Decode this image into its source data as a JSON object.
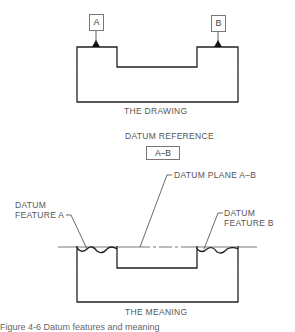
{
  "drawing": {
    "datum_a_label": "A",
    "datum_b_label": "B",
    "title": "THE DRAWING"
  },
  "reference": {
    "title": "DATUM REFERENCE",
    "frame_text": "A–B"
  },
  "meaning": {
    "datum_plane_label": "DATUM PLANE A–B",
    "feature_a_line1": "DATUM",
    "feature_a_line2": "FEATURE A",
    "feature_b_line1": "DATUM",
    "feature_b_line2": "FEATURE B",
    "title": "THE MEANING"
  },
  "caption": {
    "text": "Figure 4-6  Datum features and meaning"
  },
  "colors": {
    "line": "#222222",
    "thin": "#555555"
  }
}
